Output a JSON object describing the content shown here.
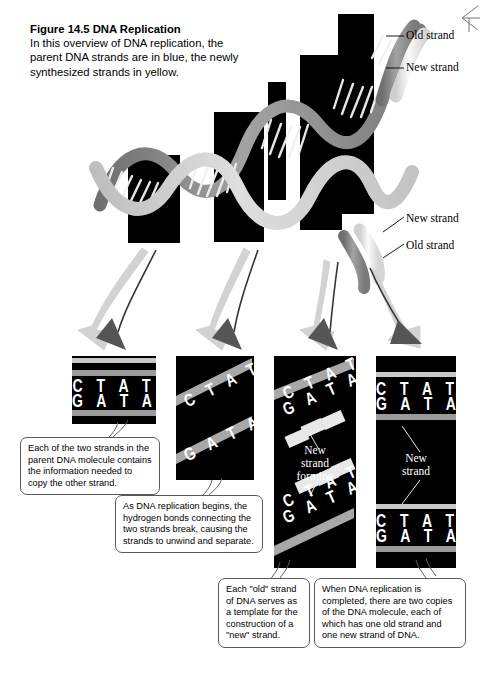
{
  "figure": {
    "number": "Figure 14.5",
    "title": "DNA Replication",
    "caption": "In this overview of DNA replication, the parent DNA strands are in blue, the newly synthesized strands in yellow."
  },
  "colors": {
    "old_strand": "#9a9a9a",
    "new_strand": "#d8d8d8",
    "panel_background": "#000000",
    "bubble_border": "#5a5a5a",
    "text": "#000000",
    "panel_text": "#ffffff"
  },
  "helix_labels": [
    {
      "text": "Old strand",
      "x": 408,
      "y": 36
    },
    {
      "text": "New strand",
      "x": 408,
      "y": 68
    },
    {
      "text": "New strand",
      "x": 408,
      "y": 219
    },
    {
      "text": "Old strand",
      "x": 408,
      "y": 246
    }
  ],
  "panels": [
    {
      "name": "panel-1-parent-duplex",
      "bases_top": "C T A T",
      "bases_bottom": "G A T A",
      "strand_note": null
    },
    {
      "name": "panel-2-unwinding",
      "bases_top": "C T A T",
      "bases_bottom": "G A T A",
      "strand_note": null
    },
    {
      "name": "panel-3-new-strand-forming",
      "bases_top": "C T A T",
      "bases_bottom": "G A T A",
      "strand_note": "New\nstrand\nforming",
      "strand_note_lines": [
        "New",
        "strand",
        "forming"
      ]
    },
    {
      "name": "panel-4-two-copies",
      "bases_top": "C T A T",
      "bases_bottom": "G A T A",
      "strand_note_lines": [
        "New",
        "strand"
      ]
    }
  ],
  "bubbles": [
    {
      "id": "bubble-1",
      "text": "Each of the two strands in the parent DNA molecule contains the information needed to copy the other strand."
    },
    {
      "id": "bubble-2",
      "text": "As DNA replication begins, the hydrogen bonds connecting the two strands break, causing the strands to unwind and separate."
    },
    {
      "id": "bubble-3",
      "text": "Each \"old\" strand of DNA serves as a template for the construction of a \"new\" strand."
    },
    {
      "id": "bubble-4",
      "text": "When DNA replication is completed, there are two copies of the DNA molecule, each of which has one old strand and one new strand of DNA."
    }
  ]
}
